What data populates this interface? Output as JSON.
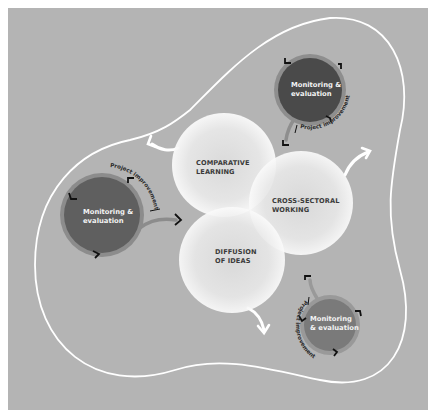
{
  "diagram": {
    "background_color": "#ffffff",
    "panel_color": "#b4b4b4",
    "boundary_color": "#ffffff",
    "center_circles": [
      {
        "id": "comparative-learning",
        "lines": [
          "COMPARATIVE",
          "LEARNING"
        ],
        "fill": "#efefef"
      },
      {
        "id": "cross-sectoral-working",
        "lines": [
          "CROSS-SECTORAL",
          "WORKING"
        ],
        "fill": "#efefef"
      },
      {
        "id": "diffusion-of-ideas",
        "lines": [
          "DIFFUSION",
          "OF IDEAS"
        ],
        "fill": "#efefef"
      }
    ],
    "me_circles": [
      {
        "id": "top-right",
        "lines": [
          "Monitoring &",
          "evaluation"
        ],
        "fill": "#4a4a4a",
        "ring": "#8e8e8e",
        "loop_label": "Project improvement"
      },
      {
        "id": "left",
        "lines": [
          "Monitoring &",
          "evaluation"
        ],
        "fill": "#5f5f5f",
        "ring": "#8c8c8c",
        "loop_label": "Project improvement"
      },
      {
        "id": "bottom-right",
        "lines": [
          "Monitoring",
          "& evaluation"
        ],
        "fill": "#7a7a7a",
        "ring": "#999999",
        "loop_label": "Project improvement"
      }
    ],
    "arrows": [
      {
        "id": "arrow-out-left",
        "color": "#ffffff"
      },
      {
        "id": "arrow-out-right",
        "color": "#ffffff"
      },
      {
        "id": "arrow-out-bottom",
        "color": "#ffffff"
      }
    ]
  }
}
